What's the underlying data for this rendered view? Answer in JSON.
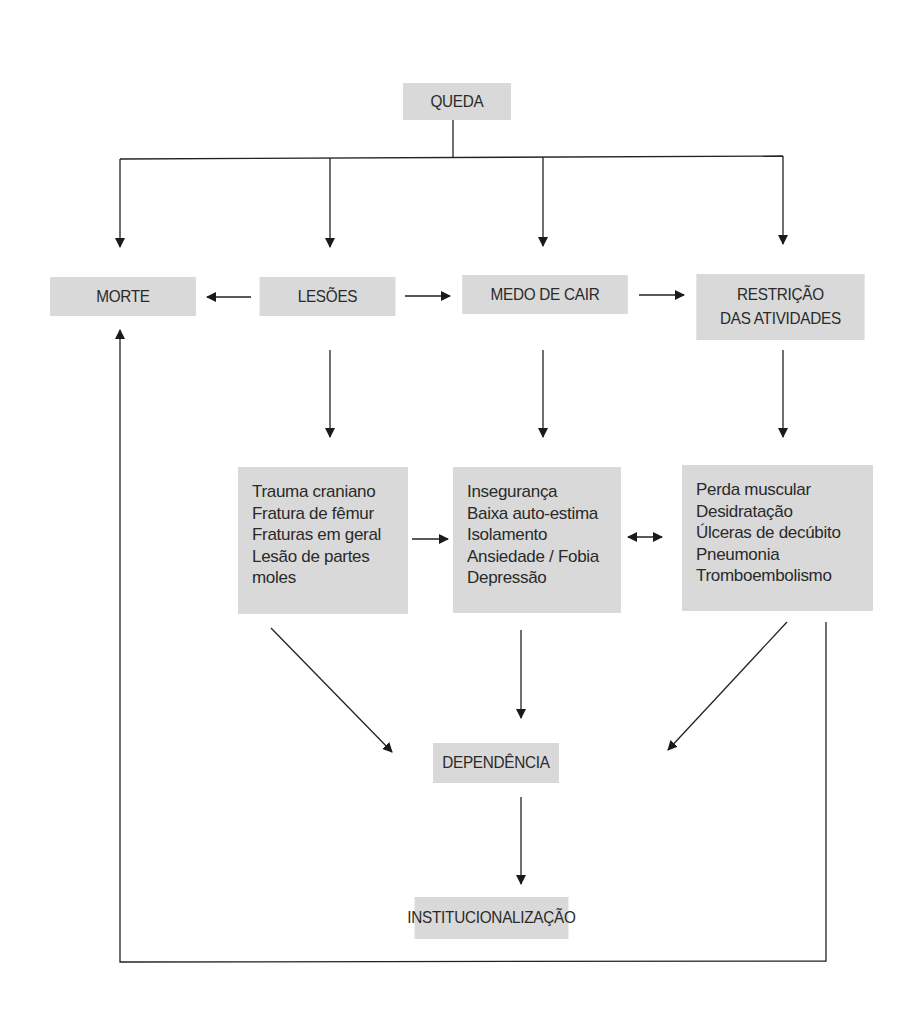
{
  "diagram": {
    "type": "flowchart",
    "nodes": {
      "queda": {
        "label": "QUEDA"
      },
      "morte": {
        "label": "MORTE"
      },
      "lesoes": {
        "label": "LESÕES"
      },
      "medo": {
        "label": "MEDO DE CAIR"
      },
      "restricao": {
        "lines": [
          "RESTRIÇÃO",
          "DAS ATIVIDADES"
        ]
      },
      "lesoes_detail": {
        "lines": [
          "Trauma craniano",
          "Fratura de fêmur",
          "Fraturas em geral",
          "Lesão de partes",
          "moles"
        ]
      },
      "medo_detail": {
        "lines": [
          "Insegurança",
          "Baixa auto-estima",
          "Isolamento",
          "Ansiedade / Fobia",
          "Depressão"
        ]
      },
      "restricao_detail": {
        "lines": [
          "Perda muscular",
          "Desidratação",
          "Úlceras de decúbito",
          "Pneumonia",
          "Tromboembolismo"
        ]
      },
      "dependencia": {
        "label": "DEPENDÊNCIA"
      },
      "institucionalizacao": {
        "label": "INSTITUCIONALIZAÇÃO"
      }
    },
    "edges": [
      {
        "from": "QUEDA",
        "to": "MORTE"
      },
      {
        "from": "QUEDA",
        "to": "LESÕES"
      },
      {
        "from": "QUEDA",
        "to": "MEDO DE CAIR"
      },
      {
        "from": "QUEDA",
        "to": "RESTRIÇÃO DAS ATIVIDADES"
      },
      {
        "from": "LESÕES",
        "to": "MORTE"
      },
      {
        "from": "LESÕES",
        "to": "MEDO DE CAIR"
      },
      {
        "from": "MEDO DE CAIR",
        "to": "RESTRIÇÃO DAS ATIVIDADES"
      },
      {
        "from": "LESÕES",
        "to": "lesoes_detail"
      },
      {
        "from": "MEDO DE CAIR",
        "to": "medo_detail"
      },
      {
        "from": "RESTRIÇÃO DAS ATIVIDADES",
        "to": "restricao_detail"
      },
      {
        "from": "lesoes_detail",
        "to": "medo_detail"
      },
      {
        "from": "medo_detail",
        "to": "restricao_detail",
        "bidirectional": true
      },
      {
        "from": "lesoes_detail",
        "to": "DEPENDÊNCIA"
      },
      {
        "from": "medo_detail",
        "to": "DEPENDÊNCIA"
      },
      {
        "from": "restricao_detail",
        "to": "DEPENDÊNCIA"
      },
      {
        "from": "DEPENDÊNCIA",
        "to": "INSTITUCIONALIZAÇÃO"
      },
      {
        "from": "restricao_detail",
        "to": "MORTE",
        "feedback_loop": true
      }
    ],
    "colors": {
      "box_fill": "#d9d9d9",
      "line": "#222222",
      "text": "#2a2a2a"
    }
  }
}
